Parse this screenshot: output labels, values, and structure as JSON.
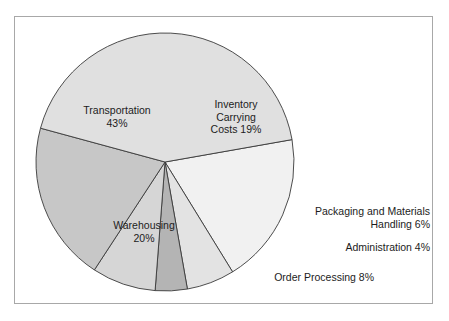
{
  "figure": {
    "background_color": "#ffffff",
    "frame_color": "#a8a8a8"
  },
  "chart_data": {
    "type": "pie",
    "title": "",
    "subtitle": "",
    "xlabel": "",
    "ylabel": "",
    "grid": false,
    "legend_position": "none",
    "label_format": "{name} {value}%",
    "units": "percent of total logistics cost",
    "total": 100,
    "start_angle_deg": -10,
    "direction": "clockwise",
    "center": {
      "x": 165,
      "y": 162
    },
    "radius": 129,
    "categories": [
      "Inventory Carrying Costs",
      "Packaging and Materials Handling",
      "Administration",
      "Order Processing",
      "Warehousing",
      "Transportation"
    ],
    "values": [
      19,
      6,
      4,
      8,
      20,
      43
    ],
    "colors": [
      "#f1f1f1",
      "#e3e3e3",
      "#b4b4b4",
      "#d6d6d6",
      "#c7c7c7",
      "#e0e0e0"
    ],
    "slices": [
      {
        "name": "Inventory Carrying Costs",
        "value": 19,
        "color": "#f1f1f1",
        "label_lines": [
          "Inventory",
          "Carrying",
          "Costs 19%"
        ],
        "label_placement": "inside"
      },
      {
        "name": "Packaging and Materials Handling",
        "value": 6,
        "color": "#e3e3e3",
        "label_lines": [
          "Packaging and Materials",
          "Handling 6%"
        ],
        "label_placement": "outside-right"
      },
      {
        "name": "Administration",
        "value": 4,
        "color": "#b4b4b4",
        "label_lines": [
          "Administration 4%"
        ],
        "label_placement": "outside-right"
      },
      {
        "name": "Order Processing",
        "value": 8,
        "color": "#d6d6d6",
        "label_lines": [
          "Order Processing 8%"
        ],
        "label_placement": "outside-bottom"
      },
      {
        "name": "Warehousing",
        "value": 20,
        "color": "#c7c7c7",
        "label_lines": [
          "Warehousing",
          "20%"
        ],
        "label_placement": "inside"
      },
      {
        "name": "Transportation",
        "value": 43,
        "color": "#e0e0e0",
        "label_lines": [
          "Transportation",
          "43%"
        ],
        "label_placement": "inside"
      }
    ]
  },
  "labels": {
    "transportation": "Transportation\n43%",
    "inventory": "Inventory\nCarrying\nCosts 19%",
    "warehousing": "Warehousing\n20%",
    "packaging": "Packaging and Materials\nHandling 6%",
    "administration": "Administration 4%",
    "order_processing": "Order Processing 8%"
  }
}
